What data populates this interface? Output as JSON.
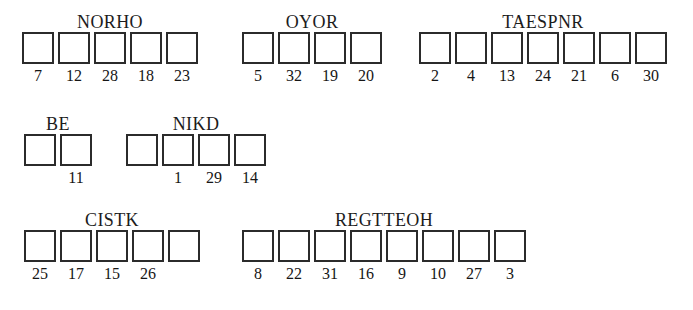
{
  "sheet": {
    "title": "Word puzzle answer grid",
    "background_color": "#ffffff",
    "box_border_color": "#2b2b2b",
    "text_color": "#1a1a1a"
  },
  "rows": [
    {
      "row_name": "row-1",
      "top": 12,
      "groups": [
        {
          "label": "NORHO",
          "left": 20,
          "cells": [
            {
              "number": "7"
            },
            {
              "number": "12"
            },
            {
              "number": "28"
            },
            {
              "number": "18"
            },
            {
              "number": "23"
            }
          ]
        },
        {
          "label": "OYOR",
          "left": 240,
          "cells": [
            {
              "number": "5"
            },
            {
              "number": "32"
            },
            {
              "number": "19"
            },
            {
              "number": "20"
            }
          ]
        },
        {
          "label": "TAESPNR",
          "left": 417,
          "cells": [
            {
              "number": "2"
            },
            {
              "number": "4"
            },
            {
              "number": "13"
            },
            {
              "number": "24"
            },
            {
              "number": "21"
            },
            {
              "number": "6"
            },
            {
              "number": "30"
            }
          ]
        }
      ]
    },
    {
      "row_name": "row-2",
      "top": 114,
      "groups": [
        {
          "label": "BE",
          "left": 22,
          "cells": [
            {
              "number": ""
            },
            {
              "number": "11"
            }
          ]
        },
        {
          "label": "NIKD",
          "left": 124,
          "cells": [
            {
              "number": ""
            },
            {
              "number": "1"
            },
            {
              "number": "29"
            },
            {
              "number": "14"
            }
          ]
        }
      ]
    },
    {
      "row_name": "row-3",
      "top": 210,
      "groups": [
        {
          "label": "CISTK",
          "left": 22,
          "cells": [
            {
              "number": "25"
            },
            {
              "number": "17"
            },
            {
              "number": "15"
            },
            {
              "number": "26"
            },
            {
              "number": ""
            }
          ]
        },
        {
          "label": "REGTTEOH",
          "left": 240,
          "cells": [
            {
              "number": "8"
            },
            {
              "number": "22"
            },
            {
              "number": "31"
            },
            {
              "number": "16"
            },
            {
              "number": "9"
            },
            {
              "number": "10"
            },
            {
              "number": "27"
            },
            {
              "number": "3"
            }
          ]
        }
      ]
    }
  ]
}
